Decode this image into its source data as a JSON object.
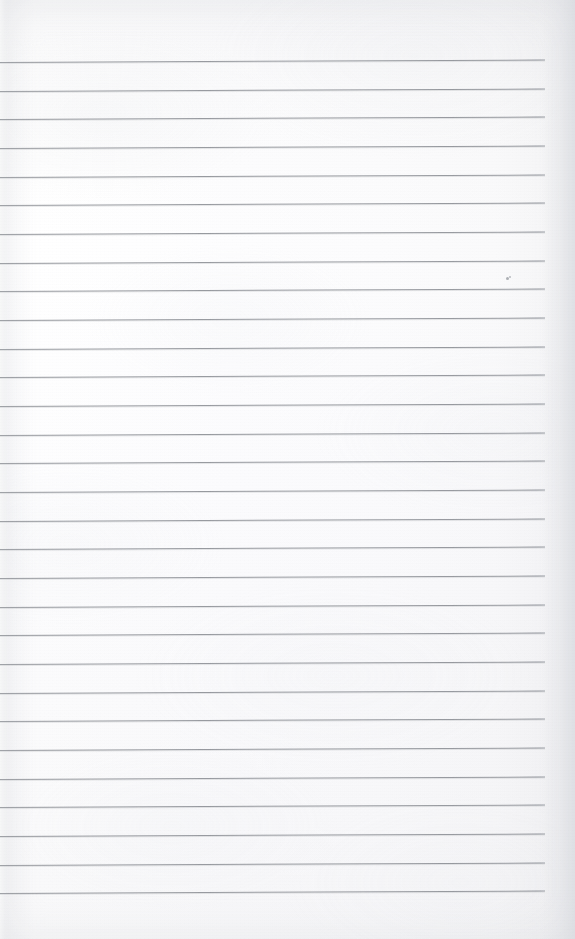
{
  "page": {
    "kind": "scanned-blank-ruled-notebook-page",
    "width": 575,
    "height": 939,
    "title": "",
    "heading": "",
    "body_text": "",
    "handwriting": "",
    "page_number": "",
    "header": "",
    "footer": "",
    "margin_label": ""
  },
  "paper": {
    "background_color": "#fcfcfc",
    "edge_shadow_color": "#eceef1",
    "has_margin_rule": false,
    "has_holes": false,
    "text_present": false
  },
  "ruling": {
    "style": "horizontal-ruled",
    "line_color": "#8b8e94",
    "line_thickness_px": 1,
    "line_count": 30,
    "first_line_y": 62,
    "line_spacing_px": 28.66,
    "line_start_x": 0,
    "line_end_x": 545,
    "skew_deg": -0.26,
    "lines": [
      {
        "index": 1,
        "y": 62,
        "x_start": 0,
        "x_end": 545
      },
      {
        "index": 2,
        "y": 91,
        "x_start": 0,
        "x_end": 545
      },
      {
        "index": 3,
        "y": 119,
        "x_start": 0,
        "x_end": 545
      },
      {
        "index": 4,
        "y": 148,
        "x_start": 0,
        "x_end": 545
      },
      {
        "index": 5,
        "y": 177,
        "x_start": 0,
        "x_end": 545
      },
      {
        "index": 6,
        "y": 205,
        "x_start": 0,
        "x_end": 545
      },
      {
        "index": 7,
        "y": 234,
        "x_start": 0,
        "x_end": 545
      },
      {
        "index": 8,
        "y": 263,
        "x_start": 0,
        "x_end": 545
      },
      {
        "index": 9,
        "y": 291,
        "x_start": 0,
        "x_end": 545
      },
      {
        "index": 10,
        "y": 320,
        "x_start": 0,
        "x_end": 545
      },
      {
        "index": 11,
        "y": 349,
        "x_start": 0,
        "x_end": 545
      },
      {
        "index": 12,
        "y": 377,
        "x_start": 0,
        "x_end": 545
      },
      {
        "index": 13,
        "y": 406,
        "x_start": 0,
        "x_end": 545
      },
      {
        "index": 14,
        "y": 435,
        "x_start": 0,
        "x_end": 545
      },
      {
        "index": 15,
        "y": 463,
        "x_start": 0,
        "x_end": 545
      },
      {
        "index": 16,
        "y": 492,
        "x_start": 0,
        "x_end": 545
      },
      {
        "index": 17,
        "y": 521,
        "x_start": 0,
        "x_end": 545
      },
      {
        "index": 18,
        "y": 549,
        "x_start": 0,
        "x_end": 545
      },
      {
        "index": 19,
        "y": 578,
        "x_start": 0,
        "x_end": 545
      },
      {
        "index": 20,
        "y": 607,
        "x_start": 0,
        "x_end": 545
      },
      {
        "index": 21,
        "y": 635,
        "x_start": 0,
        "x_end": 545
      },
      {
        "index": 22,
        "y": 664,
        "x_start": 0,
        "x_end": 545
      },
      {
        "index": 23,
        "y": 693,
        "x_start": 0,
        "x_end": 545
      },
      {
        "index": 24,
        "y": 721,
        "x_start": 0,
        "x_end": 545
      },
      {
        "index": 25,
        "y": 750,
        "x_start": 0,
        "x_end": 545
      },
      {
        "index": 26,
        "y": 779,
        "x_start": 0,
        "x_end": 545
      },
      {
        "index": 27,
        "y": 807,
        "x_start": 0,
        "x_end": 545
      },
      {
        "index": 28,
        "y": 836,
        "x_start": 0,
        "x_end": 545
      },
      {
        "index": 29,
        "y": 865,
        "x_start": 0,
        "x_end": 545
      },
      {
        "index": 30,
        "y": 893,
        "x_start": 0,
        "x_end": 545
      }
    ]
  },
  "artifacts": {
    "specks": [
      {
        "x": 506,
        "y": 277,
        "size": 3,
        "color": "#9a9da3"
      },
      {
        "x": 509,
        "y": 276,
        "size": 2,
        "color": "#a8abb1"
      }
    ]
  }
}
